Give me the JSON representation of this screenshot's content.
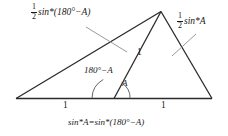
{
  "figure": {
    "type": "geometry-diagram",
    "colors": {
      "stroke": "#2b2b2b",
      "leader": "#9a9a9a",
      "text": "#1a1a1a",
      "background": "#ffffff"
    },
    "labels": {
      "left_side": {
        "fraction_numerator": "1",
        "fraction_denominator": "2",
        "expression": "sin*(180°−A)"
      },
      "right_side": {
        "fraction_numerator": "1",
        "fraction_denominator": "2",
        "expression": "sin*A"
      },
      "cevian": "1",
      "angle_obtuse": "180°−A",
      "angle_acute": "A",
      "base_left": "1",
      "base_right": "1",
      "identity": "sin*A=sin*(180°−A)"
    }
  }
}
